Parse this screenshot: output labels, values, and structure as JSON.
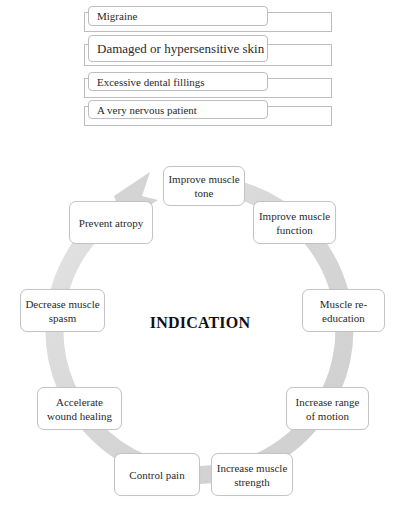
{
  "list": {
    "items": [
      {
        "label": "Migraine"
      },
      {
        "label": "Damaged or hypersensitive skin"
      },
      {
        "label": "Excessive dental fillings"
      },
      {
        "label": "A very nervous patient"
      }
    ]
  },
  "cycle": {
    "title": "INDICATION",
    "ring_color": "#d9d9d9",
    "nodes": [
      {
        "label": "Improve muscle tone"
      },
      {
        "label": "Improve muscle function"
      },
      {
        "label": "Muscle re-education"
      },
      {
        "label": "Increase range of motion"
      },
      {
        "label": "Increase muscle strength"
      },
      {
        "label": "Control pain"
      },
      {
        "label": "Accelerate wound healing"
      },
      {
        "label": "Decrease muscle spasm"
      },
      {
        "label": "Prevent atropy"
      }
    ]
  }
}
